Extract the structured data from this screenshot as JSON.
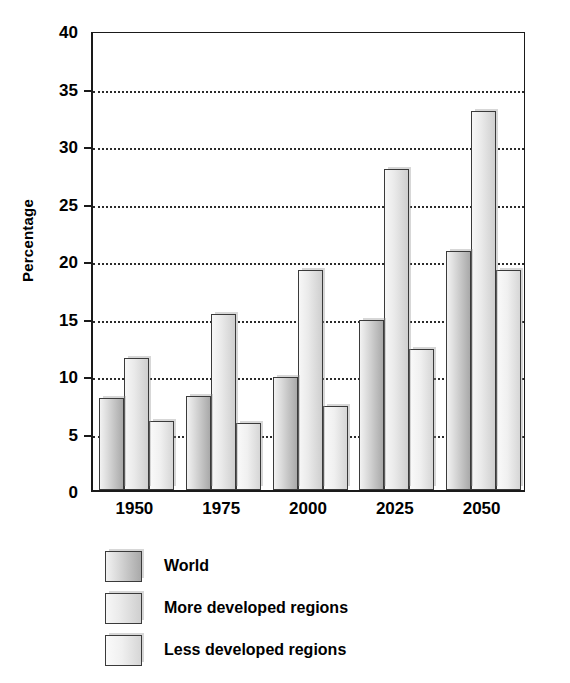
{
  "chart_data": {
    "type": "bar",
    "title": "",
    "xlabel": "",
    "ylabel": "Percentage",
    "categories": [
      "1950",
      "1975",
      "2000",
      "2025",
      "2050"
    ],
    "series": [
      {
        "name": "World",
        "values": [
          8.0,
          8.2,
          9.8,
          14.8,
          20.8
        ]
      },
      {
        "name": "More developed regions",
        "values": [
          11.5,
          15.3,
          19.1,
          27.9,
          33.0
        ]
      },
      {
        "name": "Less developed regions",
        "values": [
          6.0,
          5.8,
          7.3,
          12.3,
          19.1
        ]
      }
    ],
    "ylim": [
      0,
      40
    ],
    "ytick_values": [
      0,
      5,
      10,
      15,
      20,
      25,
      30,
      35,
      40
    ],
    "ytick_labels": [
      "0",
      "5",
      "10",
      "15",
      "20",
      "25",
      "30",
      "35",
      "40"
    ],
    "grid": true,
    "grid_style": "dotted-horizontal",
    "legend_position": "below-plot-left",
    "legend": [
      {
        "label": "World",
        "swatch": "s0"
      },
      {
        "label": "More developed regions",
        "swatch": "s1"
      },
      {
        "label": "Less developed regions",
        "swatch": "s2"
      }
    ]
  },
  "colors": {
    "series_world": "#a9a9a9",
    "series_more_developed": "#cfcfcf",
    "series_less_developed": "#e0e0e0",
    "axis": "#1a1a1a",
    "grid": "#2b2b2b",
    "background": "#ffffff"
  }
}
